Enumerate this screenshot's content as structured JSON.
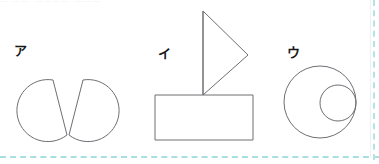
{
  "page": {
    "background_color": "#ffffff",
    "stroke_color": "#6e6e74",
    "label_color": "#17171a",
    "selection_dash_color": "#a8dfe0",
    "top_clipped_text": "—  ——   ————  ———"
  },
  "figures": [
    {
      "label": "ア",
      "name": "two-circular-sectors",
      "icon": "sector-pair-icon",
      "parts": [
        {
          "shape": "circle-with-wedge-removed",
          "side": "left"
        },
        {
          "shape": "circle-with-wedge-removed",
          "side": "right"
        }
      ]
    },
    {
      "label": "イ",
      "name": "sailboat",
      "icon": "sailboat-icon",
      "parts": [
        {
          "shape": "rectangle",
          "role": "hull"
        },
        {
          "shape": "line",
          "role": "mast"
        },
        {
          "shape": "triangle",
          "role": "sail",
          "points": "right-pointing"
        }
      ]
    },
    {
      "label": "ウ",
      "name": "circle-with-inner-circle",
      "icon": "concentric-circles-icon",
      "parts": [
        {
          "shape": "circle",
          "role": "outer"
        },
        {
          "shape": "circle",
          "role": "inner",
          "position": "tangent-right"
        }
      ]
    }
  ]
}
